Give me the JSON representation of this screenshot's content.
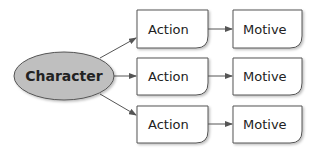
{
  "diagram": {
    "central_node": {
      "label": "Character",
      "fill": "#bfbfbf"
    },
    "rows": [
      {
        "action": "Action",
        "motive": "Motive"
      },
      {
        "action": "Action",
        "motive": "Motive"
      },
      {
        "action": "Action",
        "motive": "Motive"
      }
    ],
    "colors": {
      "stroke": "#555555",
      "box_fill": "#ffffff",
      "text": "#222222"
    }
  }
}
